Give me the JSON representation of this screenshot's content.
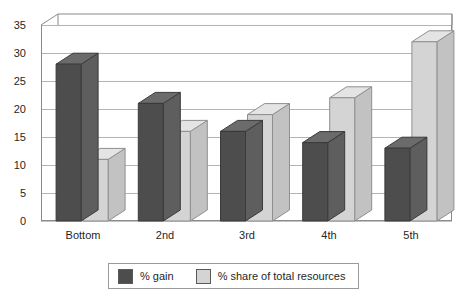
{
  "chart_data": {
    "type": "bar",
    "title": "",
    "subtitle": "",
    "xlabel": "",
    "ylabel": "",
    "categories": [
      "Bottom",
      "2nd",
      "3rd",
      "4th",
      "5th"
    ],
    "series": [
      {
        "name": "% gain",
        "color": "#4d4d4d",
        "values": [
          28,
          21,
          16,
          14,
          13
        ]
      },
      {
        "name": "% share of total resources",
        "color": "#d4d4d4",
        "values": [
          11,
          16,
          19,
          22,
          32
        ]
      }
    ],
    "ylim": [
      0,
      35
    ],
    "ytick_values": [
      0,
      5,
      10,
      15,
      20,
      25,
      30,
      35
    ],
    "ytick_labels": [
      "0",
      "5",
      "10",
      "15",
      "20",
      "25",
      "30",
      "35"
    ],
    "grid": true,
    "grid_axis": "y",
    "legend_position": "bottom",
    "style": "3d-column",
    "colors": {
      "series_1_face": "#4d4d4d",
      "series_1_side": "#5e5e5e",
      "series_1_top": "#6b6b6b",
      "series_2_face": "#d4d4d4",
      "series_2_side": "#c2c2c2",
      "series_2_top": "#e4e4e4",
      "gridline": "#b4b4b4",
      "axis": "#8a8a8a",
      "background": "#ffffff",
      "text": "#1f1f1f"
    }
  },
  "axis": {
    "y_ticks": [
      "0",
      "5",
      "10",
      "15",
      "20",
      "25",
      "30",
      "35"
    ],
    "x_ticks": [
      "Bottom",
      "2nd",
      "3rd",
      "4th",
      "5th"
    ]
  },
  "legend": {
    "entries": [
      {
        "label": "% gain"
      },
      {
        "label": "% share of total resources"
      }
    ]
  }
}
